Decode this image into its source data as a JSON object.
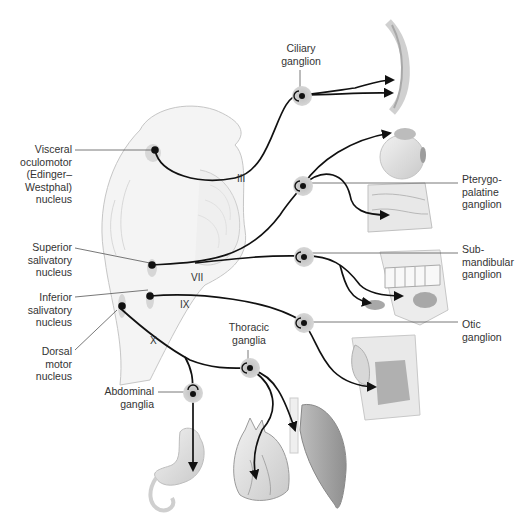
{
  "figure": {
    "nuclei": [
      {
        "id": "visceral-oculomotor",
        "lines": [
          "Visceral",
          "oculomotor",
          "(Edinger–",
          "Westphal)",
          "nucleus"
        ]
      },
      {
        "id": "superior-salivatory",
        "lines": [
          "Superior",
          "salivatory",
          "nucleus"
        ]
      },
      {
        "id": "inferior-salivatory",
        "lines": [
          "Inferior",
          "salivatory",
          "nucleus"
        ]
      },
      {
        "id": "dorsal-motor",
        "lines": [
          "Dorsal",
          "motor",
          "nucleus"
        ]
      }
    ],
    "ganglia": [
      {
        "id": "ciliary",
        "lines": [
          "Ciliary",
          "ganglion"
        ]
      },
      {
        "id": "pterygopalatine",
        "lines": [
          "Pterygo-",
          "palatine",
          "ganglion"
        ]
      },
      {
        "id": "submandibular",
        "lines": [
          "Sub-",
          "mandibular",
          "ganglion"
        ]
      },
      {
        "id": "otic",
        "lines": [
          "Otic",
          "ganglion"
        ]
      },
      {
        "id": "thoracic",
        "lines": [
          "Thoracic",
          "ganglia"
        ]
      },
      {
        "id": "abdominal",
        "lines": [
          "Abdominal",
          "ganglia"
        ]
      }
    ],
    "nerves": {
      "oculomotor": "III",
      "facial": "VII",
      "glossopharyngeal": "IX",
      "vagus": "X"
    },
    "targets": [
      "eye (pupil/lens)",
      "lacrimal gland",
      "nasal/palatine glands",
      "submandibular & sublingual glands",
      "parotid gland",
      "heart",
      "lung",
      "stomach"
    ],
    "colors": {
      "line": "#111111",
      "ganglion_halo": "#c8c8c8",
      "leader": "#555555",
      "organ_fill": "#e6e6e6"
    }
  }
}
